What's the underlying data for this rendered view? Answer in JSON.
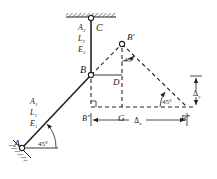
{
  "diagram": {
    "type": "two-bar truss displacement diagram (Williot)",
    "colors": {
      "ink": "#222222",
      "background": "#ffffff"
    },
    "points": {
      "A": {
        "label": "A"
      },
      "B": {
        "label": "B"
      },
      "C": {
        "label": "C"
      },
      "B_prime": {
        "label": "B′"
      },
      "B_double_prime": {
        "label": "B″"
      },
      "B_triple_prime": {
        "label": "B‴"
      },
      "D": {
        "label": "D"
      },
      "G": {
        "label": "G"
      }
    },
    "bar_BC": {
      "area": "A",
      "area_sub": "2",
      "length": "L",
      "length_sub": "2",
      "modulus": "E",
      "modulus_sub": "2"
    },
    "bar_AB": {
      "area": "A",
      "area_sub": "1",
      "length": "L",
      "length_sub": "1",
      "modulus": "E",
      "modulus_sub": "1"
    },
    "angles": {
      "at_A": "45°",
      "at_B_prime": "45°",
      "at_B_triple_prime": "45°"
    },
    "dimensions": {
      "delta_x": {
        "symbol": "Δ",
        "sub": "x"
      },
      "delta_y": {
        "symbol": "Δ",
        "sub": "y"
      }
    }
  }
}
